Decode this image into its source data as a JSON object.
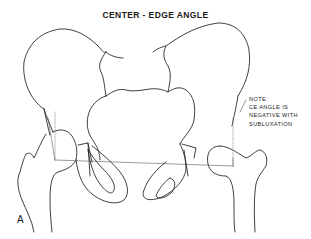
{
  "figure": {
    "title": "CENTER - EDGE ANGLE",
    "panel_label": "A",
    "note": {
      "lines": [
        "NOTE:",
        "CE ANGLE IS",
        "NEGATIVE WITH",
        "SUBLUXATION"
      ]
    },
    "elements": [
      "left-iliac-wing",
      "right-iliac-wing",
      "sacrum",
      "left-femur",
      "right-femur-subluxated",
      "left-obturator-foramen",
      "right-obturator-foramen",
      "hilgenreiner-horizontal-line",
      "center-edge-lines"
    ],
    "line_color": "#2a2a2a",
    "background": "#ffffff"
  }
}
